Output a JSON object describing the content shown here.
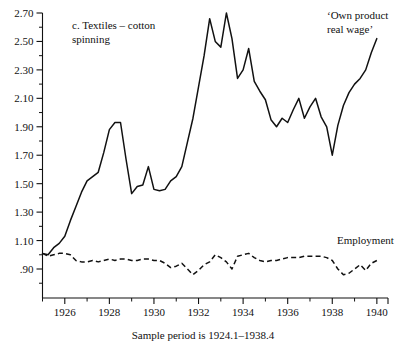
{
  "chart_data": {
    "type": "line",
    "title": "c.  Textiles – cotton spinning",
    "caption": "Sample period is 1924.1–1938.4",
    "xlabel": "",
    "ylabel": "",
    "xlim": [
      1925.0,
      1940.5
    ],
    "ylim": [
      0.8,
      2.7
    ],
    "grid": false,
    "legend_position": "inline-annotations",
    "yticks_major": [
      "2.70",
      "2.50",
      "2.30",
      "2.10",
      "1.90",
      "1.70",
      "1.50",
      "1.30",
      "1.10",
      ".90"
    ],
    "yticks_major_values": [
      2.7,
      2.5,
      2.3,
      2.1,
      1.9,
      1.7,
      1.5,
      1.3,
      1.1,
      0.9
    ],
    "yticks_minor_values": [
      2.6,
      2.4,
      2.2,
      2.0,
      1.8,
      1.6,
      1.4,
      1.2,
      1.0,
      0.8
    ],
    "xticks_major": [
      "1926",
      "1928",
      "1930",
      "1932",
      "1934",
      "1936",
      "1938",
      "1940"
    ],
    "xticks_major_values": [
      1926,
      1928,
      1930,
      1932,
      1934,
      1936,
      1938,
      1940
    ],
    "xticks_minor_values": [
      1925,
      1927,
      1929,
      1931,
      1933,
      1935,
      1937,
      1939
    ],
    "series": [
      {
        "name": "'Own product real wage'",
        "style": "solid",
        "label_text": "‘Own product\nreal wage’",
        "x": [
          1925.0,
          1925.25,
          1925.5,
          1925.75,
          1926.0,
          1926.25,
          1926.5,
          1926.75,
          1927.0,
          1927.25,
          1927.5,
          1927.75,
          1928.0,
          1928.25,
          1928.5,
          1928.75,
          1929.0,
          1929.25,
          1929.5,
          1929.75,
          1930.0,
          1930.25,
          1930.5,
          1930.75,
          1931.0,
          1931.25,
          1931.5,
          1931.75,
          1932.0,
          1932.25,
          1932.5,
          1932.75,
          1933.0,
          1933.25,
          1933.5,
          1933.75,
          1934.0,
          1934.25,
          1934.5,
          1934.75,
          1935.0,
          1935.25,
          1935.5,
          1935.75,
          1936.0,
          1936.25,
          1936.5,
          1936.75,
          1937.0,
          1937.25,
          1937.5,
          1937.75,
          1938.0,
          1938.25,
          1938.5,
          1938.75,
          1939.0,
          1939.25,
          1939.5,
          1939.75,
          1940.0
        ],
        "y": [
          1.01,
          1.0,
          1.05,
          1.08,
          1.13,
          1.24,
          1.34,
          1.44,
          1.52,
          1.55,
          1.58,
          1.72,
          1.88,
          1.93,
          1.93,
          1.67,
          1.43,
          1.48,
          1.49,
          1.62,
          1.46,
          1.45,
          1.46,
          1.52,
          1.55,
          1.62,
          1.79,
          1.96,
          2.18,
          2.4,
          2.66,
          2.5,
          2.46,
          2.7,
          2.52,
          2.24,
          2.3,
          2.45,
          2.22,
          2.15,
          2.09,
          1.95,
          1.9,
          1.96,
          1.93,
          2.02,
          2.1,
          1.96,
          2.04,
          2.1,
          1.97,
          1.9,
          1.7,
          1.91,
          2.05,
          2.14,
          2.2,
          2.24,
          2.3,
          2.42,
          2.52
        ]
      },
      {
        "name": "Employment",
        "style": "dashed",
        "label_text": "Employment",
        "x": [
          1925.0,
          1925.25,
          1925.5,
          1925.75,
          1926.0,
          1926.25,
          1926.5,
          1926.75,
          1927.0,
          1927.25,
          1927.5,
          1927.75,
          1928.0,
          1928.25,
          1928.5,
          1928.75,
          1929.0,
          1929.25,
          1929.5,
          1929.75,
          1930.0,
          1930.25,
          1930.5,
          1930.75,
          1931.0,
          1931.25,
          1931.5,
          1931.75,
          1932.0,
          1932.25,
          1932.5,
          1932.75,
          1933.0,
          1933.25,
          1933.5,
          1933.75,
          1934.0,
          1934.25,
          1934.5,
          1934.75,
          1935.0,
          1935.25,
          1935.5,
          1935.75,
          1936.0,
          1936.25,
          1936.5,
          1936.75,
          1937.0,
          1937.25,
          1937.5,
          1937.75,
          1938.0,
          1938.25,
          1938.5,
          1938.75,
          1939.0,
          1939.25,
          1939.5,
          1939.75,
          1940.0
        ],
        "y": [
          1.01,
          0.99,
          1.0,
          1.01,
          1.01,
          1.0,
          0.96,
          0.95,
          0.95,
          0.96,
          0.95,
          0.96,
          0.97,
          0.96,
          0.97,
          0.97,
          0.96,
          0.96,
          0.97,
          0.97,
          0.96,
          0.96,
          0.94,
          0.91,
          0.92,
          0.94,
          0.9,
          0.86,
          0.89,
          0.93,
          0.95,
          1.0,
          0.98,
          0.95,
          0.9,
          0.99,
          1.0,
          1.01,
          0.98,
          0.96,
          0.95,
          0.96,
          0.96,
          0.97,
          0.98,
          0.98,
          0.98,
          0.99,
          0.99,
          0.99,
          0.99,
          0.98,
          0.96,
          0.9,
          0.86,
          0.87,
          0.9,
          0.93,
          0.89,
          0.94,
          0.96
        ]
      }
    ],
    "annotations": [
      {
        "name": "panel-title",
        "lines": [
          "c.  Textiles – cotton",
          "spinning"
        ]
      },
      {
        "name": "own-product-real-wage-label",
        "lines": [
          "‘Own product",
          "real wage’"
        ]
      },
      {
        "name": "employment-label",
        "lines": [
          "Employment"
        ]
      }
    ]
  }
}
